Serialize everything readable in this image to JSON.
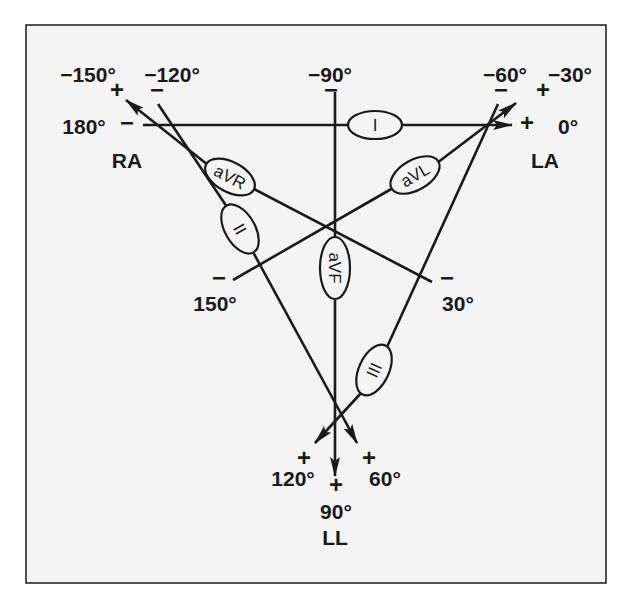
{
  "diagram": {
    "type": "einthoven-hexaxial-reference-system",
    "colors": {
      "background": "#ffffff",
      "panel": "#f4f4f4",
      "ink": "#1a1a1a"
    },
    "electrodes": {
      "ra": "RA",
      "la": "LA",
      "ll": "LL"
    },
    "leads": {
      "i": "I",
      "ii": "II",
      "iii": "III",
      "avr": "aVR",
      "avl": "aVL",
      "avf": "aVF"
    },
    "angles": {
      "neg150": "−150°",
      "neg120": "−120°",
      "neg90": "−90°",
      "neg60": "−60°",
      "neg30": "−30°",
      "deg180": "180°",
      "deg0": "0°",
      "deg150": "150°",
      "deg30": "30°",
      "deg120": "120°",
      "deg90": "90°",
      "deg60": "60°"
    },
    "polarity": {
      "plus": "+",
      "minus": "−"
    }
  }
}
